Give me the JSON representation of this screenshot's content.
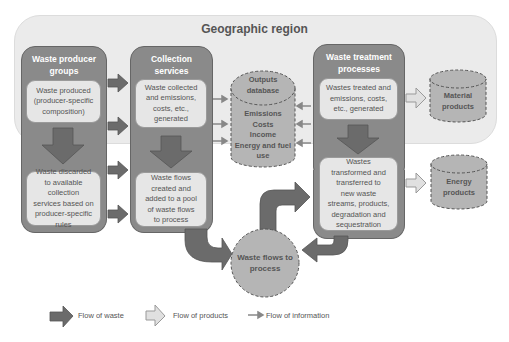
{
  "diagram": {
    "region_title": "Geographic region",
    "columns": [
      {
        "title_line1": "Waste producer",
        "title_line2": "groups",
        "top_box": [
          "Waste produced",
          "(producer-specific",
          "composition)"
        ],
        "bottom_box": [
          "Waste discarded",
          "to available",
          "collection",
          "services based on",
          "producer-specific",
          "rules"
        ]
      },
      {
        "title_line1": "Collection",
        "title_line2": "services",
        "top_box": [
          "Waste collected",
          "and emissions,",
          "costs, etc.,",
          "generated"
        ],
        "bottom_box": [
          "Waste flows",
          "created and",
          "added to a pool",
          "of waste flows",
          "to process"
        ]
      },
      {
        "title_line1": "Waste treatment",
        "title_line2": "processes",
        "top_box": [
          "Wastes treated and",
          "emissions, costs,",
          "etc., generated"
        ],
        "bottom_box": [
          "Wastes",
          "transformed and",
          "transferred to",
          "new waste",
          "streams, products,",
          "degradation and",
          "sequestration"
        ]
      }
    ],
    "outputs_database": {
      "title_line1": "Outputs",
      "title_line2": "database",
      "items": [
        "Emissions",
        "Costs",
        "Income",
        "Energy and fuel",
        "use"
      ]
    },
    "material_products": [
      "Material",
      "products"
    ],
    "energy_products": [
      "Energy",
      "products"
    ],
    "pool": [
      "Waste flows to",
      "process"
    ]
  },
  "legend": {
    "waste": "Flow of waste",
    "products": "Flow of products",
    "information": "Flow of information"
  },
  "colors": {
    "region_bg": "#ebebeb",
    "column_fill": "#8a8a8a",
    "inner_fill": "#e6e6e6",
    "waste_arrow": "#6b6b6b",
    "product_arrow": "#d9d9d9",
    "cylinder_fill": "#b5b5b5",
    "text": "#555555"
  }
}
